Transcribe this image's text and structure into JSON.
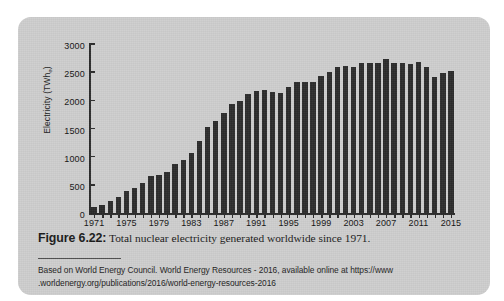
{
  "figure": {
    "label": "Figure 6.22:",
    "caption_text": " Total nuclear electricity generated worldwide since 1971.",
    "source_line1": "Based on World Energy Council. World Energy Resources - 2016, available online at https://www",
    "source_line2": ".worldenergy.org/publications/2016/world-energy-resources-2016"
  },
  "colors": {
    "bar": "#2c2c2c",
    "axis": "#2b2b2b",
    "card_background": "#cdcdcd",
    "page_background": "#ffffff",
    "text": "#141414"
  },
  "chart_data": {
    "type": "bar",
    "title": "Total nuclear electricity generated worldwide since 1971",
    "xlabel": "",
    "ylabel": "Electricity (TWhe)",
    "ylabel_display": "Electricity (TWh",
    "ylabel_sub": "e",
    "ylabel_tail": ")",
    "ylim": [
      0,
      3000
    ],
    "ytick_values": [
      0,
      500,
      1000,
      1500,
      2000,
      2500,
      3000
    ],
    "ytick_labels": [
      "0",
      "500",
      "1000",
      "1500",
      "2000",
      "2500",
      "3000"
    ],
    "xlim": [
      1970.5,
      2015.5
    ],
    "xtick_labels": [
      "1971",
      "1975",
      "1979",
      "1983",
      "1987",
      "1991",
      "1995",
      "1999",
      "2003",
      "2007",
      "2011",
      "2015"
    ],
    "xtick_values": [
      1971,
      1975,
      1979,
      1983,
      1987,
      1991,
      1995,
      1999,
      2003,
      2007,
      2011,
      2015
    ],
    "grid": false,
    "legend": null,
    "categories": [
      "1971",
      "1972",
      "1973",
      "1974",
      "1975",
      "1976",
      "1977",
      "1978",
      "1979",
      "1980",
      "1981",
      "1982",
      "1983",
      "1984",
      "1985",
      "1986",
      "1987",
      "1988",
      "1989",
      "1990",
      "1991",
      "1992",
      "1993",
      "1994",
      "1995",
      "1996",
      "1997",
      "1998",
      "1999",
      "2000",
      "2001",
      "2002",
      "2003",
      "2004",
      "2005",
      "2006",
      "2007",
      "2008",
      "2009",
      "2010",
      "2011",
      "2012",
      "2013",
      "2014",
      "2015"
    ],
    "values": [
      110,
      150,
      210,
      290,
      390,
      450,
      540,
      650,
      670,
      730,
      870,
      940,
      1060,
      1270,
      1530,
      1630,
      1780,
      1930,
      1980,
      2120,
      2160,
      2180,
      2150,
      2130,
      2240,
      2320,
      2320,
      2330,
      2440,
      2500,
      2590,
      2610,
      2590,
      2670,
      2670,
      2670,
      2730,
      2670,
      2660,
      2650,
      2680,
      2590,
      2420,
      2490,
      2520
    ]
  }
}
